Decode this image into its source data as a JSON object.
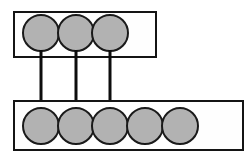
{
  "canvas": {
    "width": 252,
    "height": 156,
    "background_color": "#ffffff"
  },
  "style": {
    "box_fill": "#fefefe",
    "box_stroke": "#141414",
    "box_stroke_width": 2,
    "node_fill": "#b2b2b2",
    "node_stroke": "#1a1a1a",
    "node_stroke_width": 2,
    "edge_color": "#0d0d0d",
    "edge_width": 3
  },
  "diagram": {
    "kind": "set-mapping-diagram",
    "sets": [
      {
        "id": "upper-set",
        "name": "upper-set",
        "label": "",
        "box": {
          "x": 14,
          "y": 12,
          "width": 142,
          "height": 45
        },
        "node_radius": 18,
        "node_center_y": 33,
        "nodes": [
          {
            "id": "upper-node-1",
            "label": "",
            "cx": 41
          },
          {
            "id": "upper-node-2",
            "label": "",
            "cx": 76
          },
          {
            "id": "upper-node-3",
            "label": "",
            "cx": 110
          }
        ]
      },
      {
        "id": "lower-set",
        "name": "lower-set",
        "label": "",
        "box": {
          "x": 14,
          "y": 101,
          "width": 229,
          "height": 49
        },
        "node_radius": 18,
        "node_center_y": 126,
        "nodes": [
          {
            "id": "lower-node-1",
            "label": "",
            "cx": 41
          },
          {
            "id": "lower-node-2",
            "label": "",
            "cx": 76
          },
          {
            "id": "lower-node-3",
            "label": "",
            "cx": 110
          },
          {
            "id": "lower-node-4",
            "label": "",
            "cx": 145
          },
          {
            "id": "lower-node-5",
            "label": "",
            "cx": 180
          }
        ]
      }
    ],
    "edges": [
      {
        "id": "edge-1",
        "from": "upper-node-1",
        "to": "lower-node-1",
        "x": 41,
        "y1": 50,
        "y2": 110
      },
      {
        "id": "edge-2",
        "from": "upper-node-2",
        "to": "lower-node-2",
        "x": 76,
        "y1": 50,
        "y2": 110
      },
      {
        "id": "edge-3",
        "from": "upper-node-3",
        "to": "lower-node-3",
        "x": 110,
        "y1": 50,
        "y2": 110
      }
    ]
  }
}
